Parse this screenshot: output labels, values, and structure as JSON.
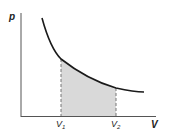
{
  "diagram": {
    "type": "pV-diagram",
    "axes": {
      "y_label": "p",
      "x_label": "V"
    },
    "markers": [
      {
        "label": "V",
        "subscript": "1"
      },
      {
        "label": "V",
        "subscript": "2"
      }
    ],
    "curve": "hyperbola p ∝ 1/V",
    "shaded_region": "area under curve between V1 and V2",
    "colors": {
      "line": "#1a1a1a",
      "axis": "#555555",
      "shade": "#d9d9d9",
      "dash": "#777777"
    }
  }
}
